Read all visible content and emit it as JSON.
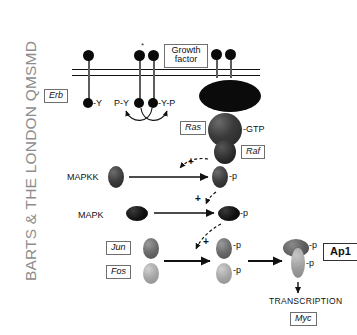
{
  "watermark": {
    "text": "BARTS & THE LONDON QMSMD"
  },
  "diagram": {
    "membrane_label": "plasma-membrane",
    "ligand": {
      "label_line1": "Growth",
      "label_line2": "factor"
    },
    "receptors": {
      "erb_label": "Erb",
      "unphosphorylated_tail": "-Y",
      "phospho_tail_left": "P-Y",
      "phospho_tail_right": "-Y-P"
    },
    "ras": {
      "label": "Ras",
      "bound_nucleotide": "-GTP"
    },
    "raf": {
      "label": "Raf"
    },
    "mapkk": {
      "label": "MAPKK",
      "phospho_label": "-p",
      "activation_sign": "+"
    },
    "mapk": {
      "label": "MAPK",
      "phospho_label": "-p",
      "activation_sign": "+"
    },
    "jun": {
      "label": "Jun",
      "phospho_label": "-p",
      "activation_sign": "+"
    },
    "fos": {
      "label": "Fos",
      "phospho_label": "-p"
    },
    "ap1": {
      "label": "Ap1",
      "phospho_label_top": "-p",
      "phospho_label_bottom": "-p"
    },
    "transcription": {
      "label": "TRANSCRIPTION"
    },
    "myc": {
      "label": "Myc"
    }
  },
  "colors": {
    "membrane": "#111111",
    "ligand_dot": "#0a0a0a",
    "receptor_body": "#0b0b0b",
    "ras": "#3a3a3a",
    "raf": "#2a2a2a",
    "mapkk": "#3b3b3b",
    "mapk": "#111111",
    "jun": "#6a6a6a",
    "fos": "#a6a6a6",
    "ap1_cap": "#5f5f5f",
    "ap1_stem": "#9d9d9d",
    "watermark": "#8d8d8d",
    "box_border": "#6f6f6f",
    "arrow": "#111111"
  }
}
